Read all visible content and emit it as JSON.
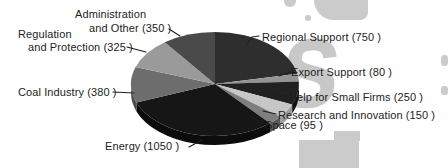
{
  "figure": {
    "background_color": "#ffffff",
    "text_color": "#1d1d1d"
  },
  "chart_data": {
    "type": "pie",
    "style": "3d",
    "direction": "clockwise",
    "start_angle_deg": 0,
    "legend_position": "callout-labels",
    "slices": [
      {
        "name": "Regional Support",
        "value": 750,
        "label": "Regional Support (750 )",
        "color": "#2e2e2e",
        "side_color": "#1d1d1d"
      },
      {
        "name": "Export Support",
        "value": 80,
        "label": "Export Support (80 )",
        "color": "#949494",
        "side_color": "#6f6f6f"
      },
      {
        "name": "Help for Small Firms",
        "value": 250,
        "label": "Help for Small Firms (250 )",
        "color": "#212121",
        "side_color": "#121212"
      },
      {
        "name": "Research and Innovation",
        "value": 150,
        "label": "Research and Innovation (150 )",
        "color": "#c6c6c6",
        "side_color": "#9f9f9f"
      },
      {
        "name": "Space",
        "value": 95,
        "label": "Space (95 )",
        "color": "#7f7f7f",
        "side_color": "#585858"
      },
      {
        "name": "Energy",
        "value": 1050,
        "label": "Energy (1050 )",
        "color": "#161616",
        "side_color": "#0c0c0c"
      },
      {
        "name": "Coal Industry",
        "value": 380,
        "label": "Coal Industry (380 )",
        "color": "#6d6d6d",
        "side_color": "#4e4e4e"
      },
      {
        "name": "Regulation and Protection",
        "value": 325,
        "label": "Regulation and Protection (325 )",
        "label_lines": [
          "Regulation",
          "and Protection (325 )"
        ],
        "color": "#9a9a9a",
        "side_color": "#757575"
      },
      {
        "name": "Administration and Other",
        "value": 350,
        "label": "Administration and Other (350 )",
        "label_lines": [
          "Administration",
          "and Other (350 )"
        ],
        "color": "#4a4a4a",
        "side_color": "#333333"
      }
    ]
  },
  "watermark": {
    "color": "#c8c8c8",
    "glyph": "s"
  }
}
